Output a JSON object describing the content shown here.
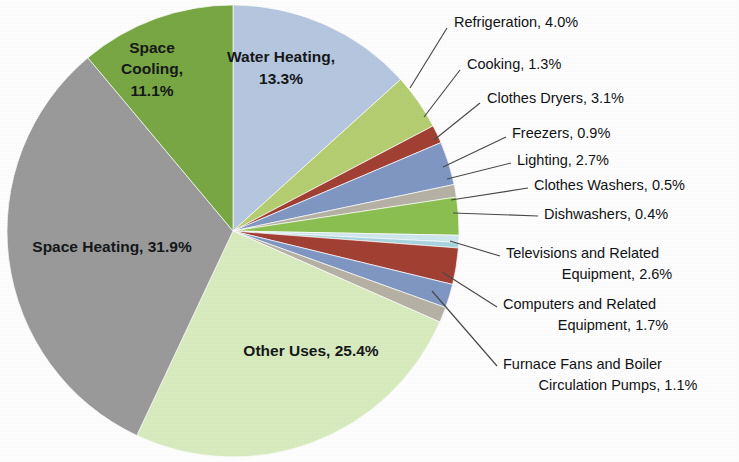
{
  "chart_data": {
    "type": "pie",
    "title": "",
    "subtitle": "",
    "xlabel": "",
    "ylabel": "",
    "legend_position": "none",
    "grid": false,
    "units": "percent",
    "total": 100.0,
    "categories": [
      "Water Heating",
      "Refrigeration",
      "Cooking",
      "Clothes Dryers",
      "Freezers",
      "Lighting",
      "Clothes Washers",
      "Dishwashers",
      "Televisions and Related Equipment",
      "Computers and Related Equipment",
      "Furnace Fans and Boiler Circulation Pumps",
      "Other Uses",
      "Space Heating",
      "Space Cooling"
    ],
    "values": [
      13.3,
      4.0,
      1.3,
      3.1,
      0.9,
      2.7,
      0.5,
      0.4,
      2.6,
      1.7,
      1.1,
      25.4,
      31.9,
      11.1
    ],
    "colors": [
      "#b6c8e0",
      "#b6cf72",
      "#a34034",
      "#8098c4",
      "#b7b2a6",
      "#8cc152",
      "#cfe8ef",
      "#a8d6e0",
      "#a34034",
      "#8098c4",
      "#b7b2a6",
      "#d9edc0",
      "#9b9b9b",
      "#7aa844"
    ],
    "slices": [
      {
        "label": "Water Heating",
        "value": 13.3,
        "display": "Water Heating, 13.3%",
        "color": "#b6c8e0",
        "label_mode": "inside"
      },
      {
        "label": "Refrigeration",
        "value": 4.0,
        "display": "Refrigeration, 4.0%",
        "color": "#b6cf72",
        "label_mode": "callout"
      },
      {
        "label": "Cooking",
        "value": 1.3,
        "display": "Cooking, 1.3%",
        "color": "#a34034",
        "label_mode": "callout"
      },
      {
        "label": "Clothes Dryers",
        "value": 3.1,
        "display": "Clothes Dryers, 3.1%",
        "color": "#8098c4",
        "label_mode": "callout"
      },
      {
        "label": "Freezers",
        "value": 0.9,
        "display": "Freezers, 0.9%",
        "color": "#b7b2a6",
        "label_mode": "callout"
      },
      {
        "label": "Lighting",
        "value": 2.7,
        "display": "Lighting, 2.7%",
        "color": "#8cc152",
        "label_mode": "callout"
      },
      {
        "label": "Clothes Washers",
        "value": 0.5,
        "display": "Clothes Washers, 0.5%",
        "color": "#cfe8ef",
        "label_mode": "callout"
      },
      {
        "label": "Dishwashers",
        "value": 0.4,
        "display": "Dishwashers, 0.4%",
        "color": "#a8d6e0",
        "label_mode": "callout"
      },
      {
        "label": "Televisions and Related Equipment",
        "value": 2.6,
        "display_line1": "Televisions and Related",
        "display_line2": "Equipment, 2.6%",
        "color": "#a34034",
        "label_mode": "callout"
      },
      {
        "label": "Computers and Related Equipment",
        "value": 1.7,
        "display_line1": "Computers and Related",
        "display_line2": "Equipment, 1.7%",
        "color": "#8098c4",
        "label_mode": "callout"
      },
      {
        "label": "Furnace Fans and Boiler Circulation Pumps",
        "value": 1.1,
        "display_line1": "Furnace Fans and Boiler",
        "display_line2": "Circulation Pumps, 1.1%",
        "color": "#b7b2a6",
        "label_mode": "callout"
      },
      {
        "label": "Other Uses",
        "value": 25.4,
        "display": "Other Uses, 25.4%",
        "color": "#d9edc0",
        "label_mode": "inside"
      },
      {
        "label": "Space Heating",
        "value": 31.9,
        "display": "Space Heating, 31.9%",
        "color": "#9b9b9b",
        "label_mode": "inside"
      },
      {
        "label": "Space Cooling",
        "value": 11.1,
        "display_line1": "Space",
        "display_line2": "Cooling,",
        "display_line3": "11.1%",
        "color": "#7aa844",
        "label_mode": "inside"
      }
    ]
  },
  "inside_labels": {
    "water_heating": "Water Heating,",
    "water_heating_pct": "13.3%",
    "space_cooling_l1": "Space",
    "space_cooling_l2": "Cooling,",
    "space_cooling_l3": "11.1%",
    "space_heating": "Space Heating, 31.9%",
    "other_uses": "Other Uses, 25.4%"
  },
  "callouts": [
    {
      "id": "refrigeration",
      "text": "Refrigeration, 4.0%"
    },
    {
      "id": "cooking",
      "text": "Cooking, 1.3%"
    },
    {
      "id": "clothes-dryers",
      "text": "Clothes Dryers, 3.1%"
    },
    {
      "id": "freezers",
      "text": "Freezers, 0.9%"
    },
    {
      "id": "lighting",
      "text": "Lighting, 2.7%"
    },
    {
      "id": "clothes-washers",
      "text": "Clothes Washers, 0.5%"
    },
    {
      "id": "dishwashers",
      "text": "Dishwashers, 0.4%"
    },
    {
      "id": "televisions-l1",
      "text": "Televisions and Related"
    },
    {
      "id": "televisions-l2",
      "text": "Equipment, 2.6%"
    },
    {
      "id": "computers-l1",
      "text": "Computers and Related"
    },
    {
      "id": "computers-l2",
      "text": "Equipment, 1.7%"
    },
    {
      "id": "furnace-l1",
      "text": "Furnace Fans and Boiler"
    },
    {
      "id": "furnace-l2",
      "text": "Circulation Pumps, 1.1%"
    }
  ]
}
